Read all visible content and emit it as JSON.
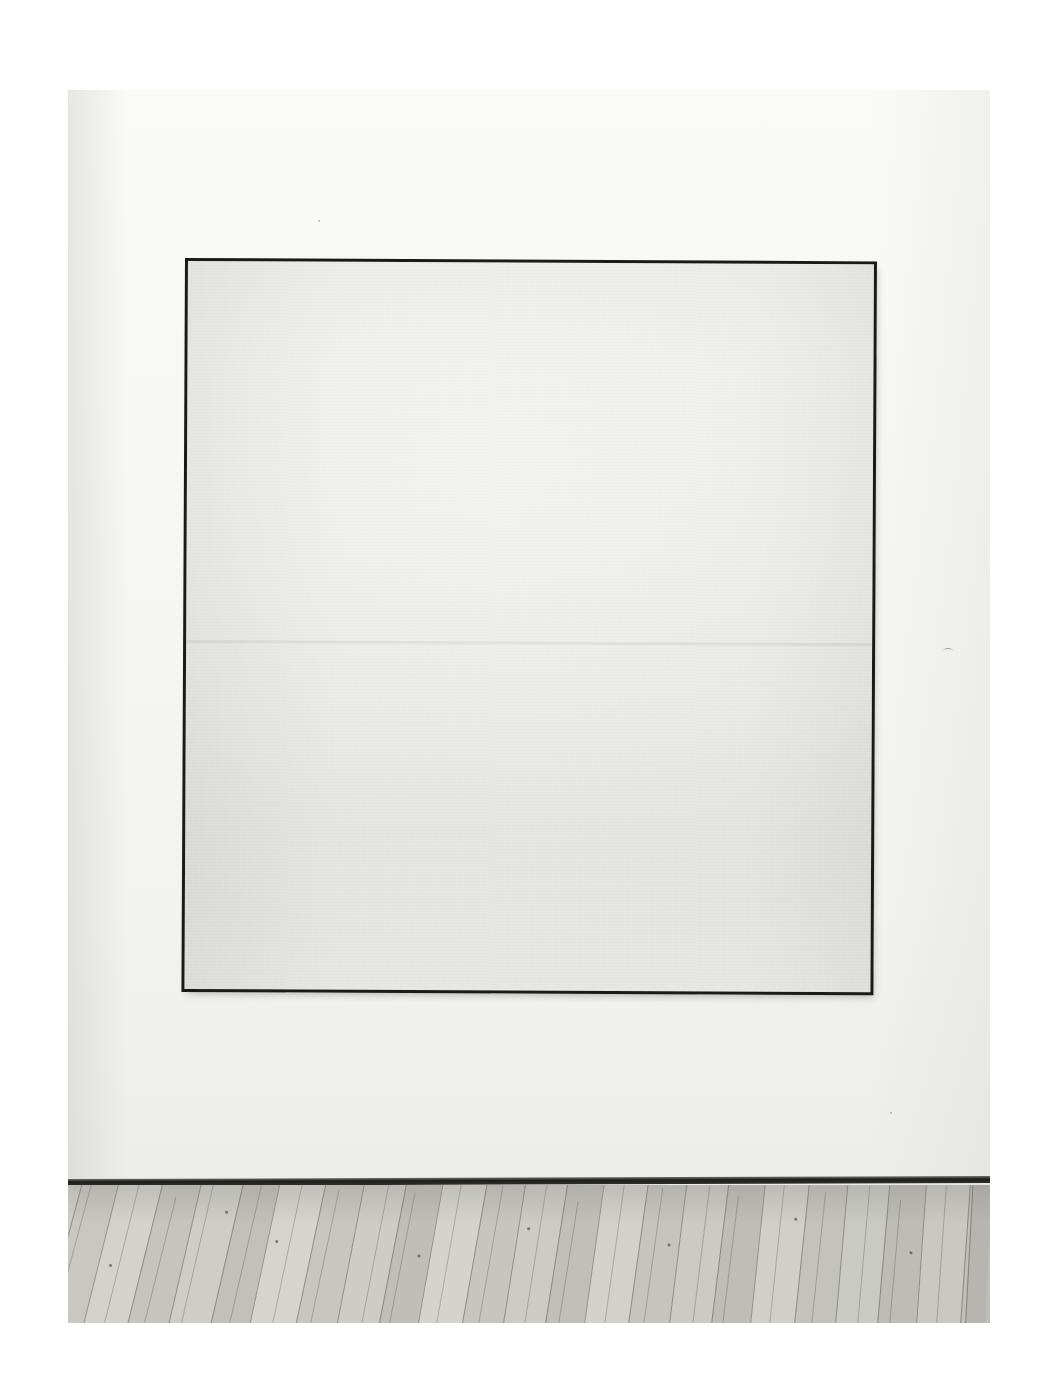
{
  "page": {
    "kind": "printed-photographic-plate",
    "background_color": "#ffffff",
    "width": 1044,
    "height": 1390,
    "caption": ""
  },
  "photograph": {
    "name": "gallery-installation-photograph",
    "subject": "large square monochrome painting installed on a gallery wall above a wooden plank floor",
    "tone": "black-and-white / desaturated",
    "bounds": {
      "left": 68,
      "top": 90,
      "width": 922,
      "height": 1233
    }
  },
  "scene": {
    "wall": {
      "label": "gallery-wall",
      "color_top": "#fbfbfa",
      "color_bottom": "#eeeeec"
    },
    "baseboard": {
      "label": "baseboard-shadow-line",
      "color": "#1d1d1b"
    },
    "floor": {
      "label": "wooden-plank-floor",
      "material": "wood",
      "plank_direction": "diagonal",
      "color_light": "#d2d1cc",
      "color_mid": "#c4c3be",
      "color_dark": "#b4b3ae",
      "plank_count": 26
    },
    "artwork": {
      "label": "monochrome-painting",
      "format": "square",
      "frame_color": "#1a1a18",
      "frame_thickness_px": 3,
      "canvas_color": "#e8e8e5",
      "canvas_description": "near-white off-white field with faint horizontal banding and woven canvas texture",
      "has_shadow": true,
      "bounds": {
        "left": 185,
        "top": 258,
        "width": 692,
        "height": 734
      }
    }
  },
  "colors": {
    "paper": "#ffffff",
    "wall": "#f7f7f6",
    "canvas": "#e8e8e5",
    "frame": "#1a1a18",
    "floor": "#c4c3be",
    "baseboard": "#1d1d1b"
  }
}
